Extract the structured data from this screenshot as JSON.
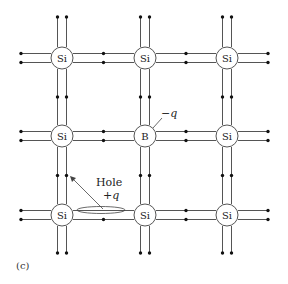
{
  "figure": {
    "caption": "(c)",
    "colors": {
      "line": "#555555",
      "dot": "#111111",
      "background": "#ffffff"
    }
  },
  "lattice": {
    "columns_x": [
      62,
      145,
      227
    ],
    "rows_y": [
      58,
      136,
      215
    ],
    "atoms": [
      [
        "Si",
        "Si",
        "Si"
      ],
      [
        "Si",
        "B",
        "Si"
      ],
      [
        "Si",
        "Si",
        "Si"
      ]
    ]
  },
  "annotations": {
    "boron_charge": "−q",
    "hole_label": "Hole",
    "hole_charge": "+q"
  }
}
